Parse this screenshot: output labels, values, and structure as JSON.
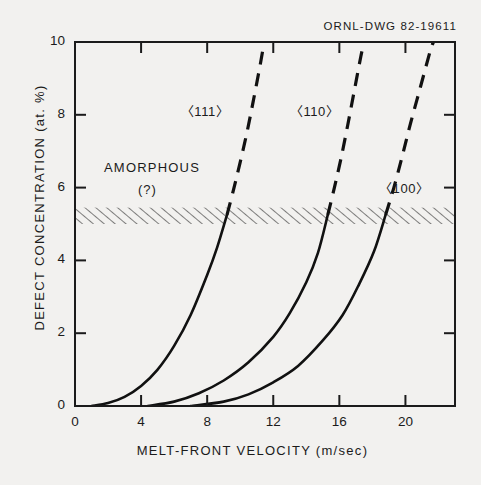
{
  "figure": {
    "drawing_number": "ORNL-DWG 82-19611"
  },
  "chart_data": {
    "type": "line",
    "title": "",
    "xlabel": "MELT-FRONT VELOCITY (m/sec)",
    "ylabel": "DEFECT CONCENTRATION (at. %)",
    "xlim": [
      0,
      23
    ],
    "ylim": [
      0,
      10
    ],
    "xticks": [
      0,
      4,
      8,
      12,
      16,
      20
    ],
    "yticks": [
      0,
      2,
      4,
      6,
      8,
      10
    ],
    "xtick_labels": [
      "0",
      "4",
      "8",
      "12",
      "16",
      "20"
    ],
    "ytick_labels": [
      "0",
      "2",
      "4",
      "6",
      "8",
      "10"
    ],
    "grid": false,
    "legend_position": "inline-annotations",
    "series": [
      {
        "name": "<111>",
        "label": "〈111〉",
        "color": "#111111",
        "solid_points": [
          [
            1.0,
            0.0
          ],
          [
            2.0,
            0.08
          ],
          [
            3.0,
            0.25
          ],
          [
            4.0,
            0.55
          ],
          [
            5.0,
            1.0
          ],
          [
            6.0,
            1.65
          ],
          [
            7.0,
            2.5
          ],
          [
            8.0,
            3.6
          ],
          [
            8.6,
            4.35
          ],
          [
            9.2,
            5.25
          ]
        ],
        "dashed_points": [
          [
            9.2,
            5.25
          ],
          [
            9.6,
            5.95
          ],
          [
            10.0,
            6.7
          ],
          [
            10.4,
            7.5
          ],
          [
            10.8,
            8.4
          ],
          [
            11.2,
            9.35
          ],
          [
            11.45,
            10.0
          ]
        ]
      },
      {
        "name": "<110>",
        "label": "〈110〉",
        "color": "#111111",
        "solid_points": [
          [
            4.4,
            0.0
          ],
          [
            6.0,
            0.12
          ],
          [
            7.5,
            0.35
          ],
          [
            9.0,
            0.7
          ],
          [
            10.5,
            1.2
          ],
          [
            12.0,
            1.9
          ],
          [
            13.0,
            2.55
          ],
          [
            14.0,
            3.4
          ],
          [
            14.7,
            4.2
          ],
          [
            15.3,
            5.25
          ]
        ],
        "dashed_points": [
          [
            15.3,
            5.25
          ],
          [
            15.7,
            6.0
          ],
          [
            16.1,
            6.8
          ],
          [
            16.5,
            7.7
          ],
          [
            16.9,
            8.65
          ],
          [
            17.3,
            9.6
          ],
          [
            17.5,
            10.0
          ]
        ]
      },
      {
        "name": "<100>",
        "label": "〈100〉",
        "color": "#111111",
        "solid_points": [
          [
            7.0,
            0.0
          ],
          [
            9.0,
            0.12
          ],
          [
            10.5,
            0.32
          ],
          [
            12.0,
            0.65
          ],
          [
            13.5,
            1.1
          ],
          [
            15.0,
            1.8
          ],
          [
            16.2,
            2.5
          ],
          [
            17.2,
            3.35
          ],
          [
            18.1,
            4.25
          ],
          [
            18.8,
            5.25
          ]
        ],
        "dashed_points": [
          [
            18.8,
            5.25
          ],
          [
            19.3,
            6.0
          ],
          [
            19.8,
            6.85
          ],
          [
            20.3,
            7.75
          ],
          [
            20.9,
            8.75
          ],
          [
            21.5,
            9.75
          ],
          [
            21.7,
            10.0
          ]
        ]
      }
    ],
    "hatched_band": {
      "name": "amorphous-transition-band",
      "y_min": 5.0,
      "y_max": 5.45,
      "hatch": "diagonal"
    },
    "annotations": [
      {
        "name": "amorphous",
        "text": "AMORPHOUS",
        "x": 3.0,
        "y": 6.8
      },
      {
        "name": "amorphous-query",
        "text": "(?)",
        "x": 4.2,
        "y": 6.2
      },
      {
        "name": "label-111",
        "text": "〈111〉",
        "x": 6.4,
        "y": 8.15
      },
      {
        "name": "label-110",
        "text": "〈110〉",
        "x": 13.0,
        "y": 8.15
      },
      {
        "name": "label-100",
        "text": "〈100〉",
        "x": 18.4,
        "y": 6.05
      }
    ]
  }
}
